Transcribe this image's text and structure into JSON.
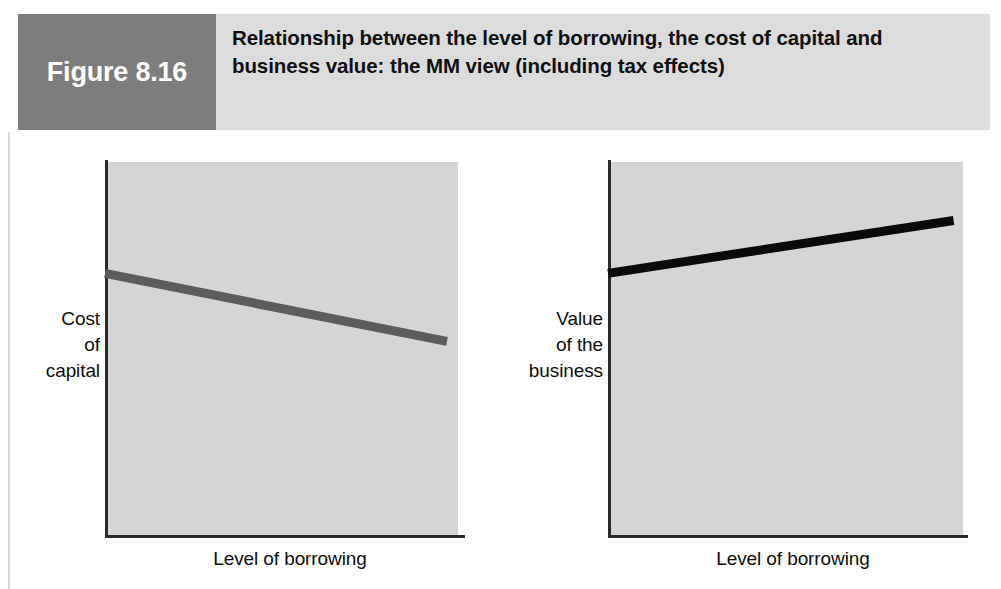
{
  "figure": {
    "tag": "Figure 8.16",
    "title": "Relationship between the level of borrowing, the cost of capital and business value: the MM view (including tax effects)"
  },
  "colors": {
    "figure_tag_background": "#7d7d7d",
    "header_band_background": "#dcdcdc",
    "plot_background": "#d5d5d5",
    "axis": "#2a2a2a",
    "cost_line": "#5c5c5c",
    "value_line": "#0a0a0a",
    "page_background": "#ffffff"
  },
  "chart_data": [
    {
      "type": "line",
      "title": "Cost of capital versus level of borrowing (MM with tax)",
      "xlabel": "Level of borrowing",
      "ylabel": "Cost\nof\ncapital",
      "ylabel_text": "Cost of capital",
      "grid": false,
      "legend": "none",
      "xlim": [
        0,
        100
      ],
      "ylim": [
        0,
        100
      ],
      "xticks": [],
      "yticks": [],
      "series": [
        {
          "name": "Cost of capital",
          "color": "#5c5c5c",
          "x": [
            0,
            95
          ],
          "y": [
            70,
            52
          ],
          "description": "Straight line sloping gently downwards as borrowing increases"
        }
      ]
    },
    {
      "type": "line",
      "title": "Value of the business versus level of borrowing (MM with tax)",
      "xlabel": "Level of borrowing",
      "ylabel": "Value\nof the\nbusiness",
      "ylabel_text": "Value of the business",
      "grid": false,
      "legend": "none",
      "xlim": [
        0,
        100
      ],
      "ylim": [
        0,
        100
      ],
      "xticks": [],
      "yticks": [],
      "series": [
        {
          "name": "Value of the business",
          "color": "#0a0a0a",
          "x": [
            0,
            96
          ],
          "y": [
            70,
            84
          ],
          "description": "Straight line sloping gently upwards as borrowing increases"
        }
      ]
    }
  ]
}
